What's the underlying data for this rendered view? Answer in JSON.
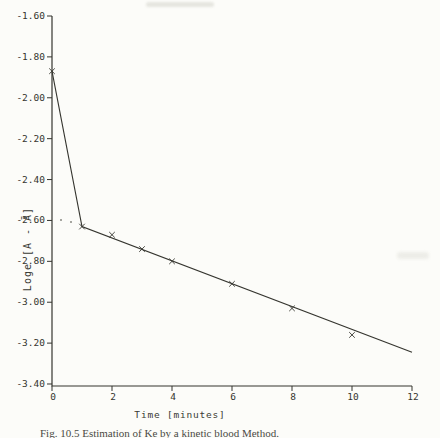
{
  "figure": {
    "caption": "Fig. 10.5  Estimation of Ke by a kinetic blood Method."
  },
  "chart_data": {
    "type": "line",
    "title": "",
    "xlabel": "Time [minutes]",
    "ylabel": "Loge [A - Ā]",
    "xlim": [
      0,
      12
    ],
    "ylim": [
      -3.4,
      -1.6
    ],
    "grid": false,
    "legend": false,
    "x_ticks": [
      0,
      2,
      4,
      6,
      8,
      10,
      12
    ],
    "x_tick_labels": [
      "0",
      "2",
      "4",
      "6",
      "8",
      "10",
      "12"
    ],
    "y_ticks": [
      -1.6,
      -1.8,
      -2.0,
      -2.2,
      -2.4,
      -2.6,
      -2.8,
      -3.0,
      -3.2,
      -3.4
    ],
    "y_tick_labels": [
      "-1.60",
      "-1.80",
      "-2.00",
      "-2.20",
      "-2.40",
      "-2.60",
      "-2.80",
      "-3.00",
      "-3.20",
      "-3.40"
    ],
    "series": [
      {
        "name": "observed-points",
        "marker": "x",
        "draw_line": false,
        "points": [
          [
            0,
            -1.87
          ],
          [
            1,
            -2.63
          ],
          [
            2,
            -2.67
          ],
          [
            3,
            -2.74
          ],
          [
            4,
            -2.8
          ],
          [
            6,
            -2.91
          ],
          [
            8,
            -3.03
          ],
          [
            10,
            -3.16
          ]
        ]
      },
      {
        "name": "fitted-line",
        "marker": null,
        "draw_line": true,
        "points": [
          [
            0,
            -1.87
          ],
          [
            1,
            -2.63
          ],
          [
            12,
            -3.245
          ]
        ]
      }
    ]
  }
}
